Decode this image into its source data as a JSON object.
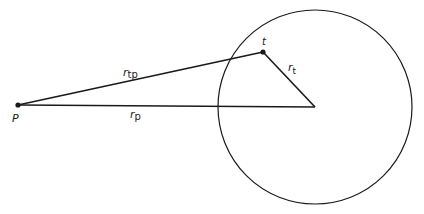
{
  "diagram": {
    "type": "geometry",
    "colors": {
      "stroke": "#1a1a1a",
      "background": "#ffffff"
    },
    "circle": {
      "cx": 315,
      "cy": 107,
      "r": 97
    },
    "points": {
      "P": {
        "x": 18,
        "y": 105,
        "label": "P"
      },
      "t": {
        "x": 263,
        "y": 52,
        "label": "t"
      },
      "center": {
        "x": 315,
        "y": 107
      }
    },
    "segments": [
      {
        "name": "r_tp",
        "from": "P",
        "to": "t",
        "label_main": "r",
        "label_sub": "tp"
      },
      {
        "name": "r_p",
        "from": "P",
        "to": "center",
        "label_main": "r",
        "label_sub": "p"
      },
      {
        "name": "r_t",
        "from": "t",
        "to": "center",
        "label_main": "r",
        "label_sub": "t"
      }
    ]
  }
}
